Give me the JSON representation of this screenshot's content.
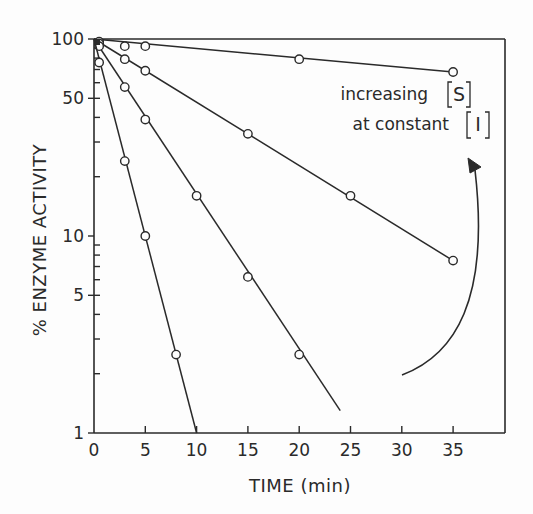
{
  "chart_data": {
    "type": "line",
    "title": "",
    "xlabel": "TIME (min)",
    "ylabel": "% ENZYME ACTIVITY",
    "xscale": "linear",
    "yscale": "log",
    "xlim": [
      0,
      40
    ],
    "ylim": [
      1,
      100
    ],
    "xticks": [
      0,
      5,
      10,
      15,
      20,
      25,
      30,
      35
    ],
    "xtick_labels": [
      "0",
      "5",
      "10",
      "15",
      "20",
      "25",
      "30",
      "35"
    ],
    "yticks": [
      1,
      5,
      10,
      50,
      100
    ],
    "ytick_labels": [
      "1",
      "5",
      "10",
      "50",
      "100"
    ],
    "grid": false,
    "legend": null,
    "marker": "open-circle",
    "series": [
      {
        "name": "slowest inactivation (highest [S])",
        "points": [
          [
            0.5,
            97
          ],
          [
            3,
            92
          ],
          [
            5,
            92
          ],
          [
            20,
            79
          ],
          [
            35,
            68
          ]
        ],
        "fit_line": [
          [
            0,
            100
          ],
          [
            35,
            68
          ]
        ]
      },
      {
        "name": "series 2",
        "points": [
          [
            0.5,
            95
          ],
          [
            3,
            79
          ],
          [
            5,
            69
          ],
          [
            15,
            33
          ],
          [
            25,
            16
          ],
          [
            35,
            7.5
          ]
        ],
        "fit_line": [
          [
            0,
            100
          ],
          [
            35,
            7.5
          ]
        ]
      },
      {
        "name": "series 3",
        "points": [
          [
            0.5,
            92
          ],
          [
            3,
            57
          ],
          [
            5,
            39
          ],
          [
            10,
            16
          ],
          [
            15,
            6.2
          ],
          [
            20,
            2.5
          ]
        ],
        "fit_line": [
          [
            0,
            100
          ],
          [
            24,
            1.3
          ]
        ]
      },
      {
        "name": "fastest inactivation (lowest [S])",
        "points": [
          [
            0.5,
            76
          ],
          [
            3,
            24
          ],
          [
            5,
            10
          ],
          [
            8,
            2.5
          ]
        ],
        "fit_line": [
          [
            0,
            100
          ],
          [
            10,
            1
          ]
        ]
      }
    ],
    "annotations": [
      {
        "text_line1": "increasing [S]",
        "text_line2": "at constant [I]",
        "position": "upper right"
      },
      {
        "type": "curved-arrow",
        "direction": "counter-clockwise upward",
        "meaning": "increasing [S]"
      }
    ]
  },
  "labels": {
    "xlabel": "TIME (min)",
    "ylabel": "% ENZYME ACTIVITY",
    "annot_line1_prefix": "increasing",
    "annot_line1_var": "S",
    "annot_line2_prefix": "at constant",
    "annot_line2_var": "I",
    "x_ticks": [
      "0",
      "5",
      "10",
      "15",
      "20",
      "25",
      "30",
      "35"
    ],
    "y_ticks": [
      "100",
      "50",
      "10",
      "5",
      "1"
    ]
  }
}
